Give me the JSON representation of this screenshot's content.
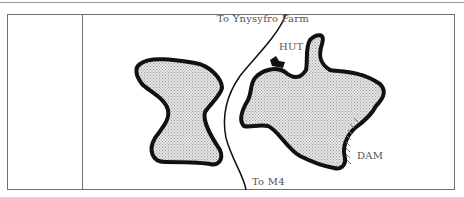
{
  "map": {
    "labels": {
      "north_road": "To Ynysyfro Farm",
      "south_road": "To M4",
      "hut": "HUT",
      "dam": "DAM"
    },
    "features": [
      {
        "type": "reservoir",
        "name": "west-reservoir",
        "fill": "stippled-grey"
      },
      {
        "type": "reservoir",
        "name": "east-reservoir",
        "fill": "stippled-grey"
      },
      {
        "type": "road",
        "name": "road-to-ynysyfro-farm-and-m4"
      },
      {
        "type": "building",
        "name": "hut"
      },
      {
        "type": "dam",
        "name": "dam"
      }
    ],
    "colors": {
      "outline": "#111111",
      "water_fill": "#d4d4d4",
      "frame": "#707070",
      "label": "#555555"
    }
  }
}
